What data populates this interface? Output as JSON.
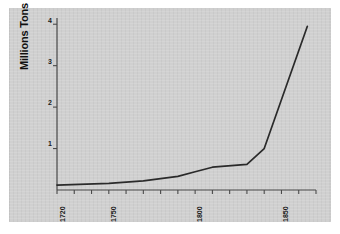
{
  "figure": {
    "background_color": "#ffffff",
    "plot_background_color": "#d0d0d0",
    "line_color": "#2a2a2a",
    "axis_color": "#4a4a4a"
  },
  "chart_data": {
    "type": "line",
    "title": "",
    "subtitle": "",
    "xlabel": "",
    "ylabel": "Millions Tons",
    "xlim": [
      1720,
      1870
    ],
    "ylim": [
      0,
      4.15
    ],
    "grid": false,
    "legend": false,
    "legend_position": "none",
    "y_ticks": [
      1,
      2,
      3,
      4
    ],
    "y_tick_labels": [
      "1",
      "2",
      "3",
      "4"
    ],
    "x_ticks": [
      1720,
      1730,
      1740,
      1750,
      1760,
      1770,
      1780,
      1790,
      1800,
      1810,
      1820,
      1830,
      1840,
      1850,
      1860,
      1870
    ],
    "x_tick_labels": [
      "1720",
      "",
      "",
      "1750",
      "",
      "",
      "",
      "",
      "1800",
      "",
      "",
      "",
      "",
      "1850",
      "",
      ""
    ],
    "x_labeled_ticks": [
      {
        "value": 1720,
        "label": "1720"
      },
      {
        "value": 1750,
        "label": "1750"
      },
      {
        "value": 1800,
        "label": "1800"
      },
      {
        "value": 1850,
        "label": "1850"
      }
    ],
    "series": [
      {
        "name": "Output",
        "x": [
          1720,
          1750,
          1770,
          1790,
          1800,
          1810,
          1830,
          1840,
          1865
        ],
        "values": [
          0.12,
          0.16,
          0.22,
          0.33,
          0.44,
          0.55,
          0.62,
          1.0,
          3.95
        ]
      }
    ]
  }
}
